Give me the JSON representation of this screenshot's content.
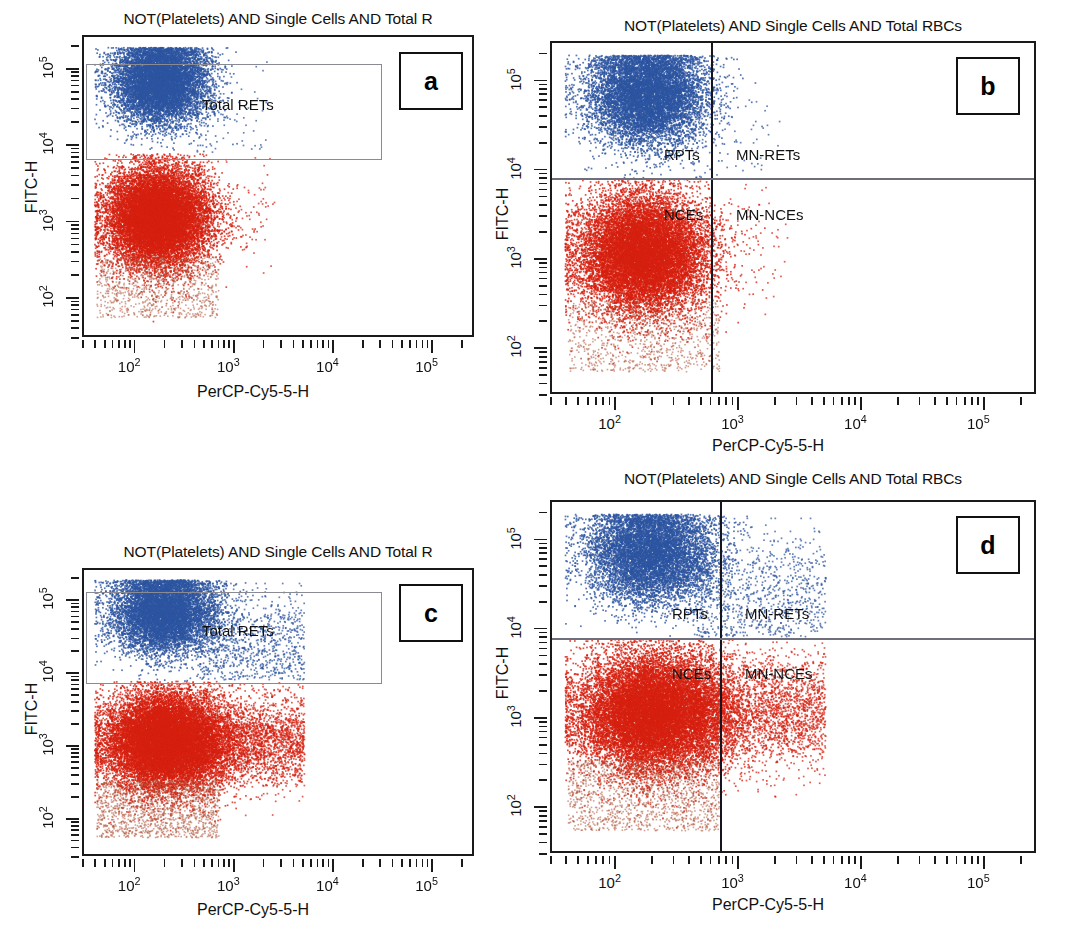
{
  "figure": {
    "kind": "flow-cytometry-dot-plot-grid",
    "panel_count": 4,
    "colors": {
      "blue_population": "#2d55a0",
      "red_population": "#d62010",
      "gate_outline": "#8a8a93",
      "quadrant_line": "#15151f",
      "frame": "#1a1a1a"
    }
  },
  "panels": [
    {
      "id": "a",
      "badge": "a",
      "title": "NOT(Platelets) AND Single Cells AND Total R",
      "xlabel": "PerCP-Cy5-5-H",
      "ylabel": "FITC-H",
      "xticks": [
        "10",
        "10",
        "10",
        "10"
      ],
      "xtick_exponents": [
        "2",
        "3",
        "4",
        "5"
      ],
      "yticks": [
        "10",
        "10",
        "10",
        "10"
      ],
      "ytick_exponents": [
        "5",
        "4",
        "3",
        "2"
      ],
      "gates": [
        {
          "name": "total-rets-gate",
          "label": "Total RETs"
        }
      ],
      "quadrants": []
    },
    {
      "id": "b",
      "badge": "b",
      "title": "NOT(Platelets) AND Single Cells AND Total RBCs",
      "xlabel": "PerCP-Cy5-5-H",
      "ylabel": "FITC-H",
      "xticks": [
        "10",
        "10",
        "10",
        "10"
      ],
      "xtick_exponents": [
        "2",
        "3",
        "4",
        "5"
      ],
      "yticks": [
        "10",
        "10",
        "10",
        "10"
      ],
      "ytick_exponents": [
        "5",
        "4",
        "3",
        "2"
      ],
      "gates": [],
      "quadrants": [
        {
          "name": "quadrant-label-rpts",
          "label": "RPTs"
        },
        {
          "name": "quadrant-label-mn-rets",
          "label": "MN-RETs"
        },
        {
          "name": "quadrant-label-nces",
          "label": "NCEs"
        },
        {
          "name": "quadrant-label-mn-nces",
          "label": "MN-NCEs"
        }
      ]
    },
    {
      "id": "c",
      "badge": "c",
      "title": "NOT(Platelets) AND Single Cells AND Total R",
      "xlabel": "PerCP-Cy5-5-H",
      "ylabel": "FITC-H",
      "xticks": [
        "10",
        "10",
        "10",
        "10"
      ],
      "xtick_exponents": [
        "2",
        "3",
        "4",
        "5"
      ],
      "yticks": [
        "10",
        "10",
        "10",
        "10"
      ],
      "ytick_exponents": [
        "5",
        "4",
        "3",
        "2"
      ],
      "gates": [
        {
          "name": "total-rets-gate",
          "label": "Total RETs"
        }
      ],
      "quadrants": []
    },
    {
      "id": "d",
      "badge": "d",
      "title": "NOT(Platelets) AND Single Cells AND Total RBCs",
      "xlabel": "PerCP-Cy5-5-H",
      "ylabel": "FITC-H",
      "xticks": [
        "10",
        "10",
        "10",
        "10"
      ],
      "xtick_exponents": [
        "2",
        "3",
        "4",
        "5"
      ],
      "yticks": [
        "10",
        "10",
        "10",
        "10"
      ],
      "ytick_exponents": [
        "5",
        "4",
        "3",
        "2"
      ],
      "gates": [],
      "quadrants": [
        {
          "name": "quadrant-label-rpts",
          "label": "RPTs"
        },
        {
          "name": "quadrant-label-mn-rets",
          "label": "MN-RETs"
        },
        {
          "name": "quadrant-label-nces",
          "label": "NCEs"
        },
        {
          "name": "quadrant-label-mn-nces",
          "label": "MN-NCEs"
        }
      ]
    }
  ],
  "chart_data": {
    "type": "scatter",
    "xlabel": "PerCP-Cy5-5-H",
    "ylabel": "FITC-H",
    "xscale": "log",
    "yscale": "log",
    "xlim": [
      30,
      270000
    ],
    "ylim": [
      30,
      270000
    ],
    "xtick_values": [
      100,
      1000,
      10000,
      100000
    ],
    "ytick_values": [
      100,
      1000,
      10000,
      100000
    ],
    "grid": false,
    "legend": "none",
    "series": [
      {
        "panel": "a",
        "name": "Total RETs (blue, CD71+/high FITC)",
        "color": "#2d55a0",
        "n_points": 9000,
        "x_center_log": 2.25,
        "x_spread_log": 0.24,
        "y_center_log": 4.85,
        "y_spread_log": 0.28,
        "description": "Dense blue cluster spanning FITC 1e4-2e5, PerCP 40-400"
      },
      {
        "panel": "a",
        "name": "NCEs (red, low FITC)",
        "color": "#d62010",
        "n_points": 14000,
        "x_center_log": 2.22,
        "x_spread_log": 0.26,
        "y_center_log": 3.05,
        "y_spread_log": 0.33,
        "description": "Dense red cluster spanning FITC 60-1e4, PerCP 40-500"
      },
      {
        "panel": "b",
        "name": "RPTs / MN-RETs (blue)",
        "color": "#2d55a0",
        "n_points": 9000,
        "x_center_log": 2.25,
        "x_spread_log": 0.24,
        "y_center_log": 4.85,
        "y_spread_log": 0.28,
        "description": "Blue cluster left of the PerCP quadrant line at ~600; sparse MN-RETs right of it"
      },
      {
        "panel": "b",
        "name": "NCEs / MN-NCEs (red)",
        "color": "#d62010",
        "n_points": 14000,
        "x_center_log": 2.22,
        "x_spread_log": 0.26,
        "y_center_log": 3.05,
        "y_spread_log": 0.33,
        "description": "Red cluster left of quadrant line; few scattered MN-NCEs right of it"
      },
      {
        "panel": "c",
        "name": "Total RETs (blue) - treated sample",
        "color": "#2d55a0",
        "n_points": 8000,
        "x_center_log": 2.28,
        "x_spread_log": 0.26,
        "y_center_log": 4.85,
        "y_spread_log": 0.28,
        "description": "Blue cluster with increased right-hand tail reaching PerCP ~4000"
      },
      {
        "panel": "c",
        "name": "NCEs (red) - treated sample",
        "color": "#d62010",
        "n_points": 16000,
        "x_center_log": 2.3,
        "x_spread_log": 0.3,
        "y_center_log": 3.05,
        "y_spread_log": 0.33,
        "description": "Red cluster with pronounced high-PerCP tail out to ~5000"
      },
      {
        "panel": "d",
        "name": "RPTs / MN-RETs (blue) - treated sample",
        "color": "#2d55a0",
        "n_points": 8000,
        "x_center_log": 2.28,
        "x_spread_log": 0.26,
        "y_center_log": 4.85,
        "y_spread_log": 0.28,
        "description": "Blue cluster plus a visible MN-RET population right of the quadrant line"
      },
      {
        "panel": "d",
        "name": "NCEs / MN-NCEs (red) - treated sample",
        "color": "#d62010",
        "n_points": 16000,
        "x_center_log": 2.3,
        "x_spread_log": 0.3,
        "y_center_log": 3.05,
        "y_spread_log": 0.33,
        "description": "Red cluster plus an elevated MN-NCE population right of the quadrant line"
      }
    ],
    "quadrant_thresholds": {
      "percp_x": 600,
      "fitc_y": 7500
    },
    "gate_total_rets": {
      "x_from": 35,
      "x_to": 35000,
      "y_from": 9000,
      "y_to": 200000
    }
  }
}
